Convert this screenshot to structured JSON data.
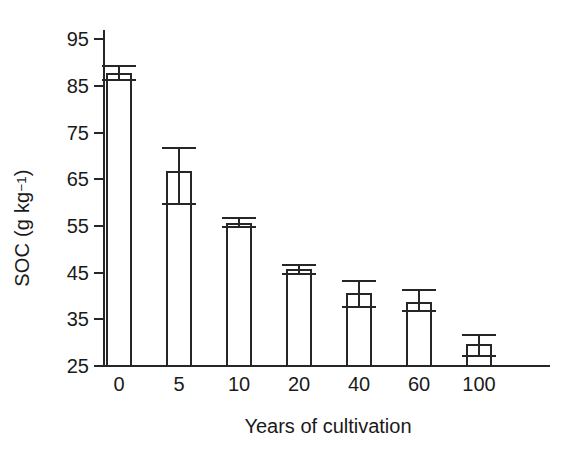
{
  "chart_data": {
    "type": "bar",
    "title": "",
    "xlabel": "Years of cultivation",
    "ylabel_plain": "SOC (g kg-1)",
    "ylabel_parts": {
      "lead": "SOC (g kg",
      "sup": "−1",
      "tail": ")"
    },
    "categories": [
      "0",
      "5",
      "10",
      "20",
      "40",
      "60",
      "100"
    ],
    "values": [
      87.5,
      66.5,
      55.5,
      45.5,
      40.5,
      38.5,
      29.5
    ],
    "errors_low": [
      86.0,
      59.5,
      54.5,
      44.5,
      37.5,
      36.5,
      27.0
    ],
    "errors_high": [
      89.0,
      71.5,
      56.5,
      46.5,
      43.0,
      41.0,
      31.5
    ],
    "ylim": [
      25,
      97
    ],
    "yticks": [
      25,
      35,
      45,
      55,
      65,
      75,
      85,
      95
    ],
    "ytick_labels": [
      "25",
      "35",
      "45",
      "55",
      "65",
      "75",
      "85",
      "95"
    ],
    "grid": false,
    "legend": null,
    "bar_fill": "#ffffff",
    "bar_edge": "#262626",
    "background": "#ffffff"
  }
}
